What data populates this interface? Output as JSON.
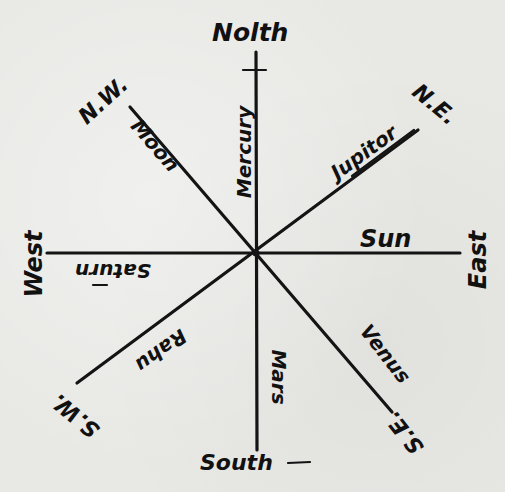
{
  "diagram": {
    "type": "hand-drawn compass rose with planetary directional rulers",
    "center": {
      "x": 256,
      "y": 253
    },
    "ink_color": "#141414",
    "paper_color": "#e8e8e5",
    "directions": {
      "north": "North",
      "south": "South",
      "east": "East",
      "west": "West",
      "north_east": "N.E.",
      "north_west": "N.W.",
      "south_east": "S.E.",
      "south_west": "S.W."
    },
    "rulers": {
      "north": "Mercury",
      "south": "Mars",
      "east": "Sun",
      "west": "Saturn",
      "north_east": "Jupiter",
      "north_west": "Moon",
      "south_east": "Venus",
      "south_west": "Rahu"
    },
    "handwritten_spellings": {
      "north": "Nolth",
      "mercury": "Mercury",
      "jupiter": "Jupitor",
      "sun": "Sun",
      "saturn": "Saturn",
      "rahu": "Rahu",
      "venus": "Venus",
      "mars": "Mars",
      "moon": "Moon"
    },
    "lines": [
      {
        "name": "north-south",
        "x1": 256,
        "y1": 52,
        "x2": 257,
        "y2": 450
      },
      {
        "name": "west-east",
        "x1": 47,
        "y1": 253,
        "x2": 460,
        "y2": 253
      },
      {
        "name": "northwest-southeast",
        "x1": 130,
        "y1": 107,
        "x2": 392,
        "y2": 412
      },
      {
        "name": "northeast-southwest",
        "x1": 418,
        "y1": 130,
        "x2": 77,
        "y2": 383
      }
    ]
  }
}
